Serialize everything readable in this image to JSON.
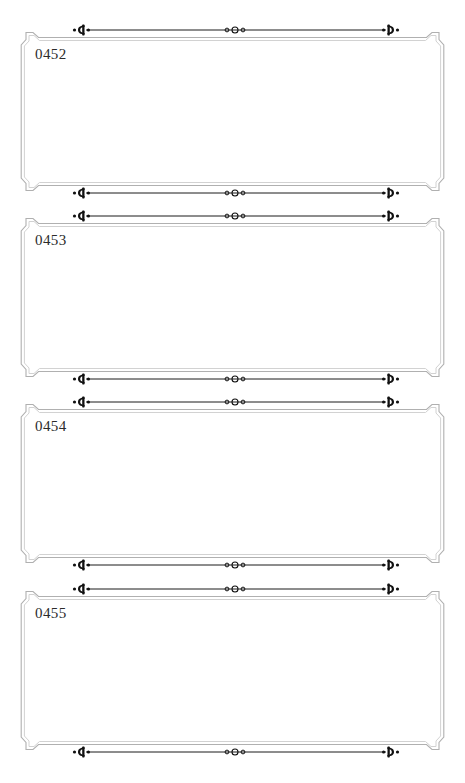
{
  "document": {
    "type": "ornamental-card-sheet",
    "page_background": "#ffffff",
    "card_count": 4
  },
  "style": {
    "frame_line_color": "#b9b9b9",
    "frame_line_color_inner": "#d6d6d6",
    "rule_color": "#1a1a1a",
    "number_color": "#2b2b2b"
  },
  "ornaments": {
    "left": "fleuron-c-icon",
    "center": "triple-circle-icon",
    "right": "fleuron-reverse-c-icon"
  },
  "cards": [
    {
      "number": "0452",
      "top": 30
    },
    {
      "number": "0453",
      "top": 216
    },
    {
      "number": "0454",
      "top": 402
    },
    {
      "number": "0455",
      "top": 589
    }
  ]
}
